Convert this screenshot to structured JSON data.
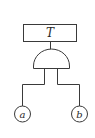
{
  "diagram": {
    "type": "fault-tree",
    "top_event": {
      "label": "T"
    },
    "gate": {
      "type": "AND"
    },
    "basic_events": [
      {
        "label": "a"
      },
      {
        "label": "b"
      }
    ],
    "colors": {
      "line": "#3a3a3a",
      "text": "#2a2a2a",
      "background": "#ffffff"
    }
  }
}
